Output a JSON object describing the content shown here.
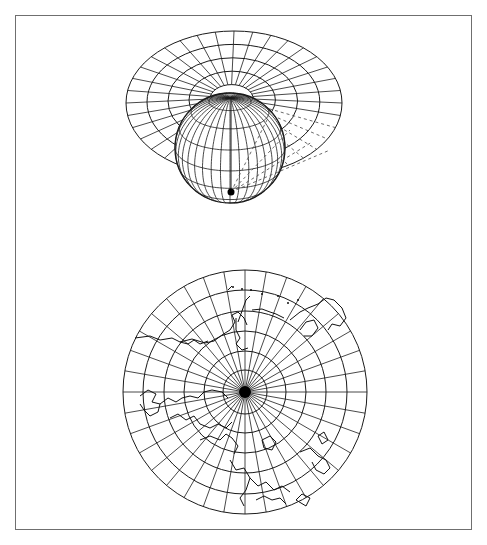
{
  "figure": {
    "canvas": {
      "width": 487,
      "height": 545,
      "background": "#ffffff"
    },
    "frame": {
      "x": 15,
      "y": 15,
      "width": 457,
      "height": 515,
      "color": "#6f6f6f"
    },
    "line_color": "#1a1a1a"
  },
  "top_illustration": {
    "description": "Globe with projection plane (azimuthal disk) tangent at the north pole",
    "plane": {
      "cx": 234,
      "cy": 103,
      "rx": 108,
      "ry": 72,
      "pole": {
        "x": 231,
        "y": 98
      },
      "rings": 5,
      "meridians": 36
    },
    "globe": {
      "cx": 230,
      "cy": 148,
      "r": 55,
      "pole": {
        "x": 231,
        "y": 98
      },
      "parallels": 8,
      "meridians": 36
    },
    "projection_point": {
      "x": 231,
      "y": 192,
      "r": 3.5
    },
    "projection_rays": "dashed"
  },
  "bottom_map": {
    "description": "Polar azimuthal projection of the northern hemisphere with coastlines",
    "cx": 245,
    "cy": 392,
    "r": 122,
    "ring_radii": [
      22,
      41,
      61,
      81,
      102,
      122
    ],
    "meridian_count": 36,
    "pole_fill_radius": 6
  }
}
